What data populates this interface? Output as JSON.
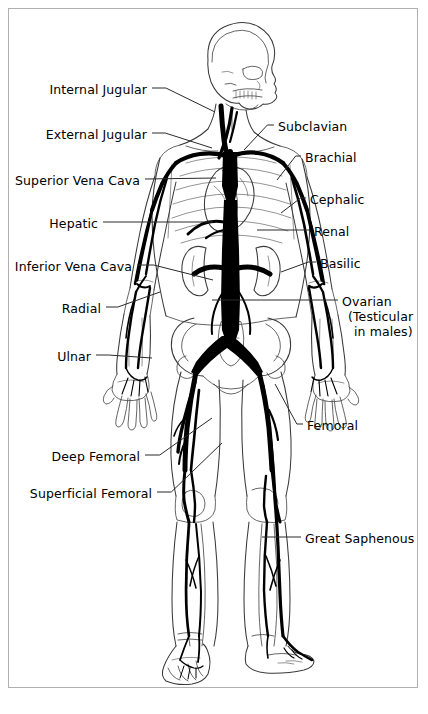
{
  "figure": {
    "orientation": "anterior whole-body human figure, head in right profile",
    "frame_color": "#b0b0b0",
    "vessel_color": "#000000",
    "outline_color": "#333333",
    "background_color": "#ffffff"
  },
  "labels_left": [
    {
      "id": "internal-jugular",
      "text": "Internal Jugular",
      "x": 60,
      "y": 82,
      "anchor_x": 152,
      "anchor_y": 88,
      "target_x": 215,
      "target_y": 112
    },
    {
      "id": "external-jugular",
      "text": "External Jugular",
      "x": 57,
      "y": 127,
      "anchor_x": 152,
      "anchor_y": 133,
      "target_x": 212,
      "target_y": 148
    },
    {
      "id": "superior-vena-cava",
      "text": "Superior Vena Cava",
      "x": 22,
      "y": 173,
      "anchor_x": 145,
      "anchor_y": 179,
      "target_x": 216,
      "target_y": 178
    },
    {
      "id": "hepatic",
      "text": "Hepatic",
      "x": 49,
      "y": 216,
      "anchor_x": 103,
      "anchor_y": 222,
      "target_x": 213,
      "target_y": 222
    },
    {
      "id": "inferior-vena-cava",
      "text": "Inferior Vena Cava",
      "x": 26,
      "y": 259,
      "anchor_x": 137,
      "anchor_y": 265,
      "target_x": 213,
      "target_y": 280
    },
    {
      "id": "radial",
      "text": "Radial",
      "x": 60,
      "y": 301,
      "anchor_x": 106,
      "anchor_y": 307,
      "target_x": 160,
      "target_y": 292
    },
    {
      "id": "ulnar",
      "text": "Ulnar",
      "x": 58,
      "y": 349,
      "anchor_x": 96,
      "anchor_y": 355,
      "target_x": 152,
      "target_y": 358
    },
    {
      "id": "deep-femoral",
      "text": "Deep Femoral",
      "x": 51,
      "y": 449,
      "anchor_x": 145,
      "anchor_y": 455,
      "target_x": 212,
      "target_y": 418
    },
    {
      "id": "superficial-femoral",
      "text": "Superficial Femoral",
      "x": 40,
      "y": 486,
      "anchor_x": 157,
      "anchor_y": 492,
      "target_x": 222,
      "target_y": 443
    }
  ],
  "labels_right": [
    {
      "id": "subclavian",
      "text": "Subclavian",
      "x": 278,
      "y": 119,
      "anchor_x": 274,
      "anchor_y": 125,
      "target_x": 244,
      "target_y": 150
    },
    {
      "id": "brachial",
      "text": "Brachial",
      "x": 305,
      "y": 150,
      "anchor_x": 301,
      "anchor_y": 156,
      "target_x": 277,
      "target_y": 180
    },
    {
      "id": "cephalic",
      "text": "Cephalic",
      "x": 310,
      "y": 192,
      "anchor_x": 306,
      "anchor_y": 198,
      "target_x": 281,
      "target_y": 213
    },
    {
      "id": "renal",
      "text": "Renal",
      "x": 314,
      "y": 224,
      "anchor_x": 310,
      "anchor_y": 230,
      "target_x": 257,
      "target_y": 230
    },
    {
      "id": "basilic",
      "text": "Basilic",
      "x": 320,
      "y": 256,
      "anchor_x": 316,
      "anchor_y": 262,
      "target_x": 281,
      "target_y": 272
    },
    {
      "id": "femoral",
      "text": "Femoral",
      "x": 307,
      "y": 418,
      "anchor_x": 303,
      "anchor_y": 424,
      "target_x": 275,
      "target_y": 384
    },
    {
      "id": "great-saphenous",
      "text": "Great Saphenous",
      "x": 305,
      "y": 531,
      "anchor_x": 301,
      "anchor_y": 537,
      "target_x": 262,
      "target_y": 537
    }
  ],
  "labels_multiline": [
    {
      "id": "ovarian",
      "lines": [
        "Ovarian",
        "(Testicular",
        "in males)"
      ],
      "x": 342,
      "y": 294,
      "anchor_x": 338,
      "anchor_y": 300,
      "target_x": 212,
      "target_y": 300
    }
  ],
  "anatomy_parts": [
    "skull",
    "mandible",
    "cervical spine",
    "clavicle",
    "rib cage",
    "heart",
    "liver region",
    "kidneys",
    "pelvis",
    "femur",
    "tibia",
    "fibula",
    "humerus",
    "radius",
    "ulna",
    "hand bones",
    "foot bones"
  ]
}
